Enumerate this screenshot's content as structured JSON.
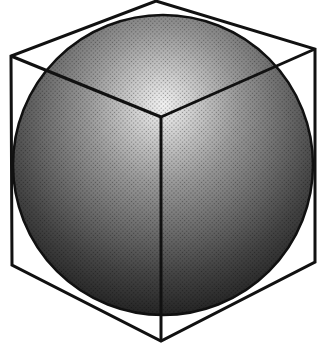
{
  "diagram": {
    "description": "Sphere inscribed in a cube, isometric view",
    "colors": {
      "background": "#ffffff",
      "line": "#111111",
      "sphere_light": "#ffffff",
      "sphere_dark": "#1a1a1a"
    },
    "sphere": {
      "cx": 163,
      "cy": 165,
      "r": 150
    },
    "cube": {
      "outline": [
        [
          156,
          1
        ],
        [
          315,
          49
        ],
        [
          315,
          262
        ],
        [
          161,
          341
        ],
        [
          12,
          265
        ],
        [
          11,
          56
        ]
      ],
      "inner_vertex": [
        161,
        117
      ],
      "inner_edges_to": [
        [
          11,
          56
        ],
        [
          315,
          49
        ],
        [
          161,
          341
        ]
      ]
    },
    "stroke_width": 3
  }
}
